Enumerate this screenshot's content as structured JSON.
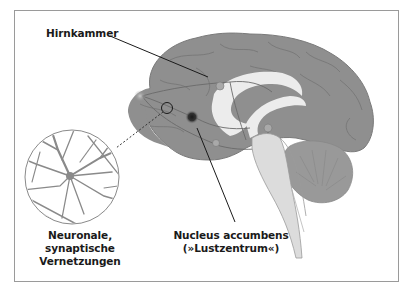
{
  "diagram": {
    "colors": {
      "brain": "#8f8f8f",
      "brain_stroke": "#7a7a7a",
      "ventricle": "#ececec",
      "cerebellum": "#999999",
      "brainstem": "#dcdcdc",
      "nucleus_accumbens": "#2a2a2a",
      "frame": "#9a9a9a",
      "leader_line": "#1a1a1a"
    },
    "labels": {
      "hirnkammer": "Hirnkammer",
      "neuronal_line1": "Neuronale, synaptische",
      "neuronal_line2": "Vernetzungen",
      "nucleus_line1": "Nucleus accumbens",
      "nucleus_line2": "(»Lustzentrum«)"
    },
    "icons": [
      "brain-illustration",
      "neuron-network-inset",
      "magnifier-circle-marker"
    ]
  }
}
